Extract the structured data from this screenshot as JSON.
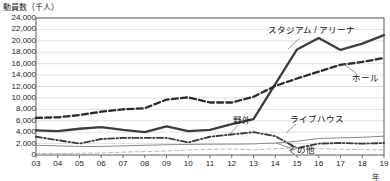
{
  "chart_data": {
    "type": "line",
    "title": "動員数（千人）",
    "xlabel": "年",
    "ylabel": "動員数（千人）",
    "ylim": [
      0,
      24000
    ],
    "ytick_step": 2000,
    "yticks": [
      "24,000",
      "22,000",
      "20,000",
      "18,000",
      "16,000",
      "14,000",
      "12,000",
      "10,000",
      "8,000",
      "6,000",
      "4,000",
      "2,000",
      "0"
    ],
    "ytick_values": [
      24000,
      22000,
      20000,
      18000,
      16000,
      14000,
      12000,
      10000,
      8000,
      6000,
      4000,
      2000,
      0
    ],
    "grid": true,
    "legend_position": "inline-annotations",
    "categories": [
      "03",
      "04",
      "05",
      "06",
      "07",
      "08",
      "09",
      "10",
      "11",
      "12",
      "13",
      "14",
      "15",
      "16",
      "17",
      "18",
      "19"
    ],
    "x": [
      2003,
      2004,
      2005,
      2006,
      2007,
      2008,
      2009,
      2010,
      2011,
      2012,
      2013,
      2014,
      2015,
      2016,
      2017,
      2018,
      2019
    ],
    "series": [
      {
        "name": "スタジアム / アリーナ",
        "style": "solid-thick",
        "color": "#3d3d3d",
        "values": [
          4300,
          4200,
          4600,
          4900,
          4400,
          4000,
          5000,
          4200,
          4400,
          5400,
          6300,
          12400,
          18500,
          20500,
          18400,
          19500,
          21000
        ]
      },
      {
        "name": "ホール",
        "style": "dashed-thick",
        "color": "#2b2b2b",
        "values": [
          6500,
          6600,
          7000,
          7600,
          8000,
          8200,
          9700,
          10100,
          9200,
          9200,
          10200,
          12100,
          13400,
          14600,
          15800,
          16300,
          17000
        ]
      },
      {
        "name": "野外",
        "style": "dash-dot",
        "color": "#3a3a3a",
        "values": [
          3200,
          2600,
          2000,
          2800,
          3000,
          3000,
          3000,
          2200,
          3200,
          3600,
          4000,
          3300,
          1200,
          2000,
          2100,
          2000,
          2100
        ]
      },
      {
        "name": "ライブハウス",
        "style": "solid-thin",
        "color": "#8a8a8a",
        "values": [
          1700,
          1600,
          1500,
          1500,
          1600,
          1700,
          1800,
          1850,
          1900,
          1900,
          1950,
          2100,
          2400,
          2900,
          3000,
          3100,
          3300
        ]
      },
      {
        "name": "その他",
        "style": "dashed-thin",
        "color": "#b3b3b3",
        "values": [
          250,
          250,
          300,
          350,
          500,
          600,
          700,
          900,
          1000,
          1050,
          900,
          1100,
          1300,
          1100,
          1000,
          950,
          900
        ]
      }
    ],
    "annotations": [
      {
        "id": "stadium",
        "text": "スタジアム / アリーナ",
        "x": 268,
        "y": 26,
        "leader": [
          [
            300,
            38
          ],
          [
            288,
            49
          ]
        ]
      },
      {
        "id": "hall",
        "text": "ホール",
        "x": 352,
        "y": 74,
        "leader": [
          [
            356,
            73
          ],
          [
            342,
            63
          ]
        ]
      },
      {
        "id": "outdoor",
        "text": "野外",
        "x": 233,
        "y": 116,
        "leader": [
          [
            238,
            125
          ],
          [
            230,
            134
          ]
        ]
      },
      {
        "id": "livehouse",
        "text": "ライブハウス",
        "x": 290,
        "y": 115,
        "leader": [
          [
            296,
            124
          ],
          [
            286,
            133
          ]
        ]
      },
      {
        "id": "other",
        "text": "その他",
        "x": 288,
        "y": 146,
        "leader": [
          [
            290,
            148
          ],
          [
            276,
            143
          ]
        ]
      }
    ]
  },
  "geometry": {
    "plot_left": 36,
    "plot_right": 384,
    "plot_top": 18,
    "plot_bottom": 155
  }
}
